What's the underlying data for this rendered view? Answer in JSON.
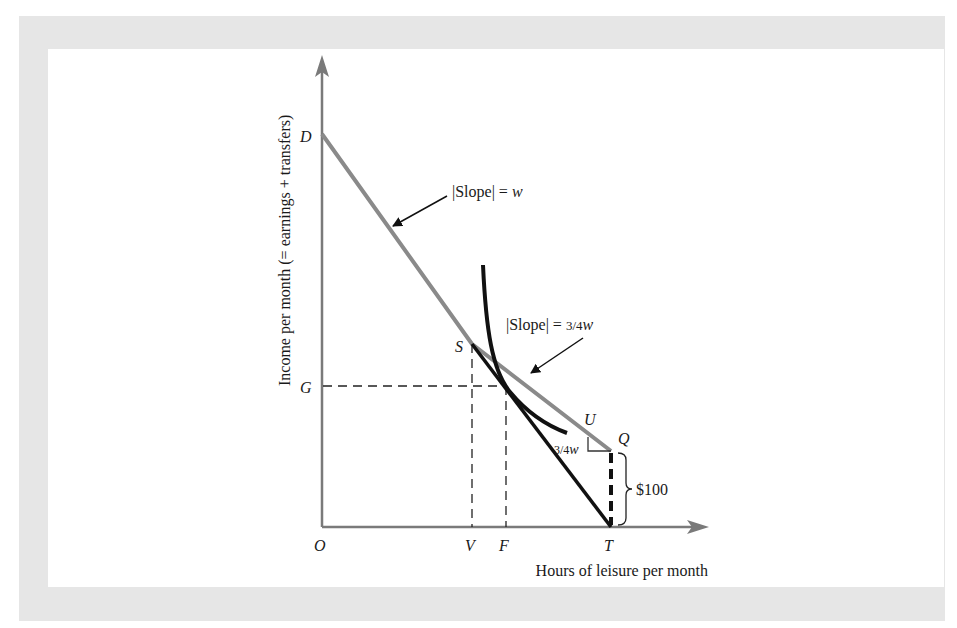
{
  "figure": {
    "type": "budget-constraint-diagram",
    "colors": {
      "frame": "#e6e6e6",
      "background": "#ffffff",
      "axis": "#7a7a7a",
      "budget_line": "#8a8a8a",
      "indifference_curve": "#111111",
      "text": "#1a1a1a"
    },
    "axes": {
      "y_label": "Income per month (= earnings + transfers)",
      "x_label": "Hours of leisure per month"
    },
    "points": {
      "origin": "O",
      "D": "D",
      "G": "G",
      "S": "S",
      "V": "V",
      "F": "F",
      "T": "T",
      "U": "U",
      "Q": "Q"
    },
    "annotations": {
      "slope_w": {
        "abs_open": "|",
        "word": "Slope",
        "abs_close": "|",
        "equals": " = ",
        "value": "w"
      },
      "slope_34w": {
        "abs_open": "|",
        "word": "Slope",
        "abs_close": "|",
        "equals": " = ",
        "fraction": "3/4",
        "value": "w"
      },
      "triangle_label": {
        "fraction": "3/4",
        "value": "w"
      },
      "transfer_amount": "$100"
    }
  }
}
